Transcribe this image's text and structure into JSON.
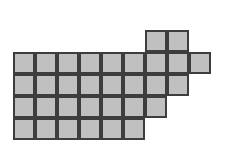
{
  "figure": {
    "name": "staircase-square-grid",
    "cell_size_px": 22,
    "origin_x_px": 13,
    "origin_y_px": 30,
    "total_squares": 32,
    "colors": {
      "fill": "#c0c0c0",
      "border": "#3d3d3d",
      "background": "#ffffff"
    },
    "rows": [
      {
        "row_index": 0,
        "start_col": 6,
        "count": 2
      },
      {
        "row_index": 1,
        "start_col": 0,
        "count": 9
      },
      {
        "row_index": 2,
        "start_col": 0,
        "count": 8
      },
      {
        "row_index": 3,
        "start_col": 0,
        "count": 7
      },
      {
        "row_index": 4,
        "start_col": 0,
        "count": 6
      }
    ],
    "cells": [
      {
        "row": 0,
        "col": 6
      },
      {
        "row": 0,
        "col": 7
      },
      {
        "row": 1,
        "col": 0
      },
      {
        "row": 1,
        "col": 1
      },
      {
        "row": 1,
        "col": 2
      },
      {
        "row": 1,
        "col": 3
      },
      {
        "row": 1,
        "col": 4
      },
      {
        "row": 1,
        "col": 5
      },
      {
        "row": 1,
        "col": 6
      },
      {
        "row": 1,
        "col": 7
      },
      {
        "row": 1,
        "col": 8
      },
      {
        "row": 2,
        "col": 0
      },
      {
        "row": 2,
        "col": 1
      },
      {
        "row": 2,
        "col": 2
      },
      {
        "row": 2,
        "col": 3
      },
      {
        "row": 2,
        "col": 4
      },
      {
        "row": 2,
        "col": 5
      },
      {
        "row": 2,
        "col": 6
      },
      {
        "row": 2,
        "col": 7
      },
      {
        "row": 3,
        "col": 0
      },
      {
        "row": 3,
        "col": 1
      },
      {
        "row": 3,
        "col": 2
      },
      {
        "row": 3,
        "col": 3
      },
      {
        "row": 3,
        "col": 4
      },
      {
        "row": 3,
        "col": 5
      },
      {
        "row": 3,
        "col": 6
      },
      {
        "row": 4,
        "col": 0
      },
      {
        "row": 4,
        "col": 1
      },
      {
        "row": 4,
        "col": 2
      },
      {
        "row": 4,
        "col": 3
      },
      {
        "row": 4,
        "col": 4
      },
      {
        "row": 4,
        "col": 5
      }
    ]
  }
}
